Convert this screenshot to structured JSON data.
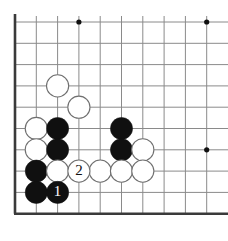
{
  "figure": {
    "type": "go-board-diagram",
    "title": ""
  },
  "board": {
    "corner": "bottom-left",
    "grid": {
      "origin_x": 15,
      "origin_y": 22,
      "spacing": 21.3,
      "columns": 10,
      "rows": 10
    },
    "colors": {
      "background": "#ffffff",
      "grid_line": "#8a8a8a",
      "edge_line": "#3a3a3a",
      "black_stone": "#101010",
      "white_stone": "#ffffff",
      "white_stone_outline": "#6f6f6f",
      "star_point": "#101010",
      "label_on_black": "#ffffff",
      "label_on_white": "#101010"
    },
    "edges": {
      "left": true,
      "bottom": true,
      "top": false,
      "right": false
    },
    "star_points": [
      {
        "col": 3,
        "row": 0
      },
      {
        "col": 9,
        "row": 0
      },
      {
        "col": 9,
        "row": 6
      }
    ],
    "stones": [
      {
        "col": 2,
        "row": 3,
        "color": "white",
        "label": ""
      },
      {
        "col": 3,
        "row": 4,
        "color": "white",
        "label": ""
      },
      {
        "col": 1,
        "row": 5,
        "color": "white",
        "label": ""
      },
      {
        "col": 2,
        "row": 5,
        "color": "black",
        "label": ""
      },
      {
        "col": 5,
        "row": 5,
        "color": "black",
        "label": ""
      },
      {
        "col": 1,
        "row": 6,
        "color": "white",
        "label": ""
      },
      {
        "col": 2,
        "row": 6,
        "color": "black",
        "label": ""
      },
      {
        "col": 5,
        "row": 6,
        "color": "black",
        "label": ""
      },
      {
        "col": 6,
        "row": 6,
        "color": "white",
        "label": ""
      },
      {
        "col": 1,
        "row": 7,
        "color": "black",
        "label": ""
      },
      {
        "col": 2,
        "row": 7,
        "color": "white",
        "label": ""
      },
      {
        "col": 4,
        "row": 7,
        "color": "white",
        "label": ""
      },
      {
        "col": 5,
        "row": 7,
        "color": "white",
        "label": ""
      },
      {
        "col": 6,
        "row": 7,
        "color": "white",
        "label": ""
      },
      {
        "col": 1,
        "row": 8,
        "color": "black",
        "label": ""
      },
      {
        "col": 3,
        "row": 7,
        "color": "white",
        "label": "2"
      },
      {
        "col": 2,
        "row": 8,
        "color": "black",
        "label": "1"
      }
    ],
    "move_labels": [
      {
        "number": "1",
        "color": "black",
        "col": 2,
        "row": 8
      },
      {
        "number": "2",
        "color": "white",
        "col": 3,
        "row": 7
      }
    ]
  }
}
